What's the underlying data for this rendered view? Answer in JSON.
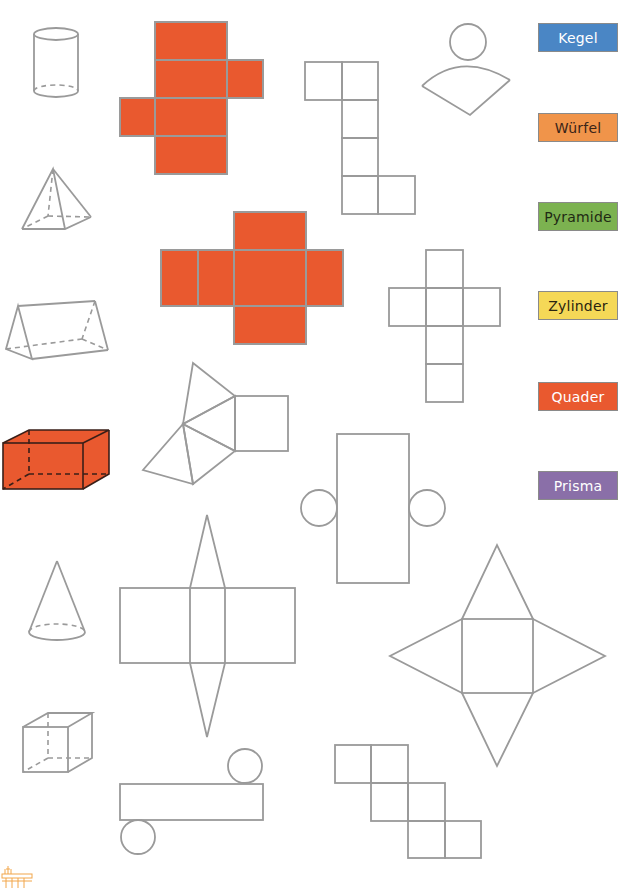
{
  "worksheet": {
    "labels": [
      {
        "text": "Kegel",
        "bg": "#4a86c5",
        "fg": "#ffffff"
      },
      {
        "text": "Würfel",
        "bg": "#f0944a",
        "fg": "#3a2418"
      },
      {
        "text": "Pyramide",
        "bg": "#7cb250",
        "fg": "#1f2a14"
      },
      {
        "text": "Zylinder",
        "bg": "#f5d857",
        "fg": "#2a2410"
      },
      {
        "text": "Quader",
        "bg": "#e9592f",
        "fg": "#ffffff"
      },
      {
        "text": "Prisma",
        "bg": "#8a6fa8",
        "fg": "#ffffff"
      }
    ],
    "solids": [
      "cylinder",
      "pyramid",
      "triangular-prism",
      "cuboid",
      "cone",
      "cube"
    ],
    "nets": [
      "cuboid-net-colored",
      "cube-net-colored",
      "cube-net",
      "cone-net",
      "cube-net-cross",
      "triangular-prism-net",
      "cylinder-net",
      "square-pyramid-net",
      "cylinder-net-horizontal",
      "cube-net-staircase"
    ],
    "colors": {
      "line": "#9a9a9a",
      "highlight": "#e9592f",
      "highlight_edge": "#3a1f18",
      "logo": "#f2a64a"
    }
  }
}
